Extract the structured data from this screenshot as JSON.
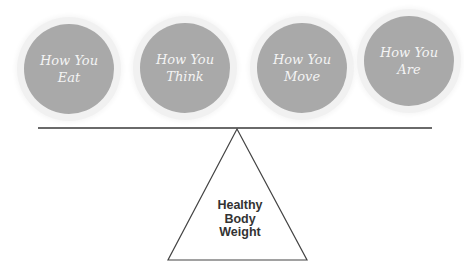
{
  "circles": [
    {
      "line1": "How You",
      "line2": "Eat"
    },
    {
      "line1": "How You",
      "line2": "Think"
    },
    {
      "line1": "How You",
      "line2": "Move"
    },
    {
      "line1": "How You",
      "line2": "Are"
    }
  ],
  "fulcrum": {
    "line1": "Healthy",
    "line2": "Body",
    "line3": "Weight"
  },
  "colors": {
    "circle_fill": "#a9a9a9",
    "circle_text": "#f4f4f4",
    "beam": "#6a6a6a",
    "triangle_stroke": "#444444"
  }
}
